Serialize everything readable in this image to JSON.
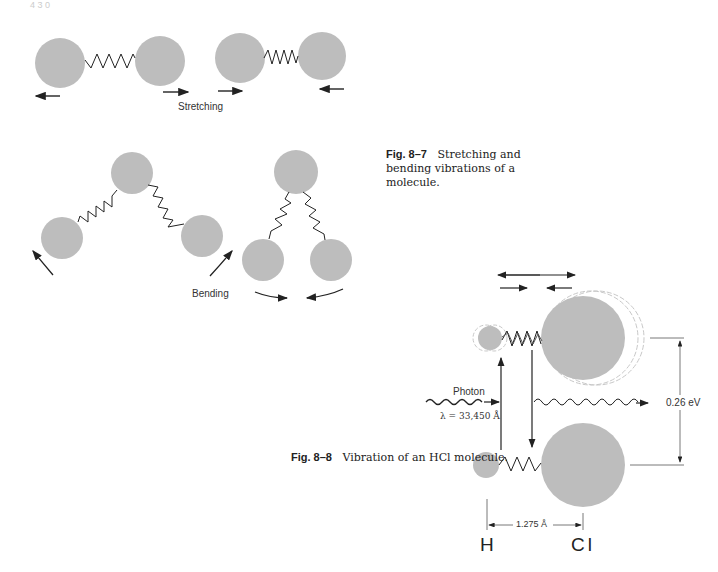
{
  "page": {
    "header_fragment": "4 3 0"
  },
  "figure_8_7": {
    "label": "Fig. 8–7",
    "caption": "Stretching and bending vibrations of a molecule.",
    "stretching_label": "Stretching",
    "bending_label": "Bending"
  },
  "figure_8_8": {
    "label": "Fig. 8–8",
    "caption": "Vibration of an HCl molecule.",
    "photon_label": "Photon",
    "wavelength_label": "λ = 33,450 Å",
    "energy_label": "0.26 eV",
    "bond_length_label": "1.275 Å",
    "atom_left": "H",
    "atom_right": "Cl"
  },
  "colors": {
    "atom_fill": "#bdbdbd",
    "line": "#222222",
    "ghost": "#c8c8c8"
  }
}
